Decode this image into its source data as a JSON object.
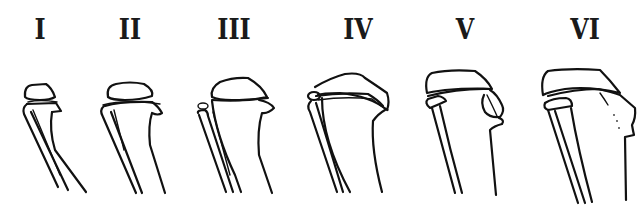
{
  "figure": {
    "stages": [
      {
        "label": "I",
        "x": 40
      },
      {
        "label": "II",
        "x": 130
      },
      {
        "label": "III",
        "x": 233
      },
      {
        "label": "IV",
        "x": 358
      },
      {
        "label": "V",
        "x": 465
      },
      {
        "label": "VI",
        "x": 585
      }
    ]
  }
}
